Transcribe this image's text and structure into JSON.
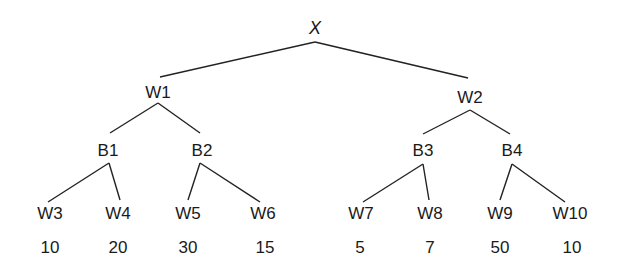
{
  "diagram": {
    "type": "game-tree",
    "root": {
      "id": "X",
      "label": "X",
      "x": 315,
      "y": 28,
      "apex": [
        315,
        42
      ]
    },
    "level1": [
      {
        "id": "W1",
        "label": "W1",
        "x": 158,
        "y": 92,
        "edge_end": [
          160,
          77
        ],
        "apex": [
          158,
          103
        ]
      },
      {
        "id": "W2",
        "label": "W2",
        "x": 470,
        "y": 97,
        "edge_end": [
          468,
          78
        ],
        "apex": [
          470,
          110
        ]
      }
    ],
    "level2": [
      {
        "id": "B1",
        "label": "B1",
        "parent": "W1",
        "x": 108,
        "y": 150,
        "edge_end": [
          110,
          133
        ],
        "apex": [
          109,
          163
        ]
      },
      {
        "id": "B2",
        "label": "B2",
        "parent": "W1",
        "x": 202,
        "y": 150,
        "edge_end": [
          200,
          133
        ],
        "apex": [
          200,
          163
        ]
      },
      {
        "id": "B3",
        "label": "B3",
        "parent": "W2",
        "x": 423,
        "y": 150,
        "edge_end": [
          423,
          134
        ],
        "apex": [
          423,
          164
        ]
      },
      {
        "id": "B4",
        "label": "B4",
        "parent": "W2",
        "x": 512,
        "y": 150,
        "edge_end": [
          510,
          134
        ],
        "apex": [
          512,
          164
        ]
      }
    ],
    "leaves": [
      {
        "id": "W3",
        "label": "W3",
        "parent": "B1",
        "x": 50,
        "y": 213,
        "edge_end": [
          48,
          202
        ],
        "value": "10",
        "value_x": 50
      },
      {
        "id": "W4",
        "label": "W4",
        "parent": "B1",
        "x": 118,
        "y": 213,
        "edge_end": [
          120,
          200
        ],
        "value": "20",
        "value_x": 118
      },
      {
        "id": "W5",
        "label": "W5",
        "parent": "B2",
        "x": 188,
        "y": 213,
        "edge_end": [
          188,
          200
        ],
        "value": "30",
        "value_x": 188
      },
      {
        "id": "W6",
        "label": "W6",
        "parent": "B2",
        "x": 263,
        "y": 213,
        "edge_end": [
          260,
          202
        ],
        "value": "15",
        "value_x": 265
      },
      {
        "id": "W7",
        "label": "W7",
        "parent": "B3",
        "x": 361,
        "y": 213,
        "edge_end": [
          363,
          202
        ],
        "value": "5",
        "value_x": 360
      },
      {
        "id": "W8",
        "label": "W8",
        "parent": "B3",
        "x": 430,
        "y": 213,
        "edge_end": [
          429,
          200
        ],
        "value": "7",
        "value_x": 430
      },
      {
        "id": "W9",
        "label": "W9",
        "parent": "B4",
        "x": 500,
        "y": 213,
        "edge_end": [
          500,
          200
        ],
        "value": "50",
        "value_x": 500
      },
      {
        "id": "W10",
        "label": "W10",
        "parent": "B4",
        "x": 570,
        "y": 213,
        "edge_end": [
          565,
          202
        ],
        "value": "10",
        "value_x": 572
      }
    ],
    "value_row_y": 247,
    "colors": {
      "line": "#222222",
      "text": "#1a1a1a",
      "background": "#ffffff"
    }
  }
}
